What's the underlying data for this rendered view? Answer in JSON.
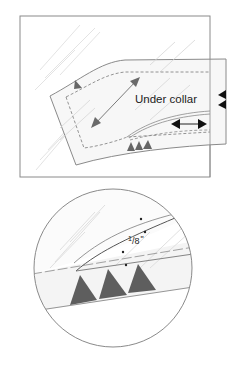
{
  "top_figure": {
    "label": "Under collar",
    "colors": {
      "outline": "#8a8a8a",
      "fill": "#f7f7f7",
      "grain": "#d8d8d8",
      "marker": "#5a5a5a",
      "notch": "#111111"
    }
  },
  "detail_figure": {
    "measurement_whole": "1",
    "measurement_frac": "/8",
    "measurement_unit": "\"",
    "colors": {
      "outline": "#8a8a8a",
      "fill": "#f4f4f4",
      "triangle": "#5e5e5e"
    }
  }
}
